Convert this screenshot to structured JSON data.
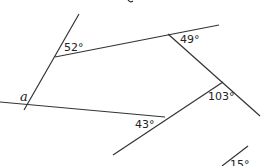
{
  "diagram": {
    "type": "geometry-angles",
    "variable_label": "a",
    "angles": [
      {
        "id": "angle-52",
        "label": "52°"
      },
      {
        "id": "angle-49",
        "label": "49°"
      },
      {
        "id": "angle-103",
        "label": "103°"
      },
      {
        "id": "angle-43",
        "label": "43°"
      },
      {
        "id": "angle-15",
        "label": "15°"
      }
    ],
    "colors": {
      "line": "#333333",
      "text": "#222222",
      "background": "#ffffff"
    }
  }
}
